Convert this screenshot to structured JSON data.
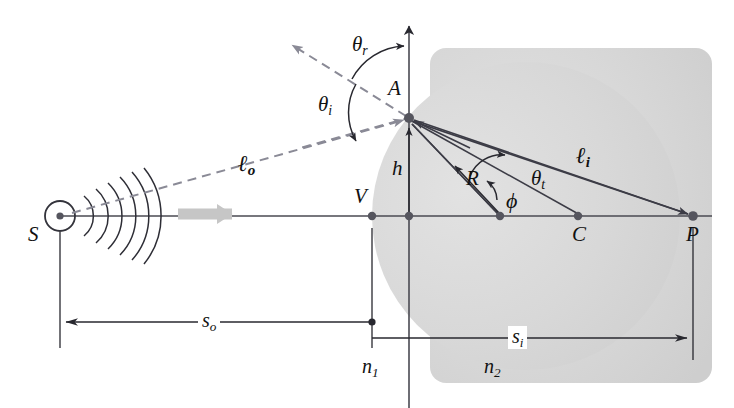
{
  "figure": {
    "colors": {
      "medium_fill": "#d4d4d4",
      "medium_fill_light": "#dcdcdc",
      "ray_solid": "#3c3c46",
      "ray_dashed": "#8a8a96",
      "wave_arrow": "#c8c8c8",
      "text": "#111111"
    }
  },
  "points": {
    "source": "S",
    "vertex": "V",
    "incidence": "A",
    "center": "C",
    "image": "P"
  },
  "angles": {
    "reflected": "θ",
    "reflected_sub": "r",
    "incident": "θ",
    "incident_sub": "i",
    "transmitted": "θ",
    "transmitted_sub": "t",
    "phi": "ϕ"
  },
  "lengths": {
    "object_ray": "ℓ",
    "object_ray_sub": "o",
    "image_ray": "ℓ",
    "image_ray_sub": "i",
    "height": "h",
    "radius": "R",
    "object_distance": "s",
    "object_distance_sub": "o",
    "image_distance": "s",
    "image_distance_sub": "i"
  },
  "media": {
    "first": "n",
    "first_sub": "1",
    "second": "n",
    "second_sub": "2"
  },
  "geometry": {
    "source_xy": [
      60,
      216
    ],
    "vertex_xy": [
      372,
      216
    ],
    "incidence_xy": [
      408,
      118
    ],
    "center_xy": [
      578,
      216
    ],
    "image_xy": [
      693,
      216
    ],
    "radius_vertex_xy": [
      500,
      216
    ],
    "sphere_radius": 154,
    "sphere_center_xy": [
      526,
      216
    ],
    "axis_y": 216,
    "body_rect": [
      526,
      48,
      712,
      383
    ],
    "so_dim_y": 322,
    "si_dim_y": 338
  }
}
